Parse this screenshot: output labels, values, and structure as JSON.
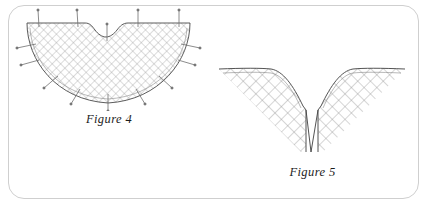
{
  "panel": {
    "border_color": "#cfcfcf",
    "background_color": "#ffffff",
    "corner_radius": "16px"
  },
  "figures": [
    {
      "id": "figure-4",
      "caption": "Figure 4",
      "shape": "semicircular fan with shallow central notch",
      "mesh_color": "#9a9a9a",
      "outline_color": "#4a4a4a",
      "pin_color": "#6e6e6e",
      "mesh_pitch": 6,
      "pin_count": 14
    },
    {
      "id": "figure-5",
      "caption": "Figure 5",
      "shape": "V-shaped chevron with deep central slit",
      "mesh_color": "#8f8f8f",
      "outline_color": "#3f3f3f",
      "mesh_pitch": 9
    }
  ]
}
